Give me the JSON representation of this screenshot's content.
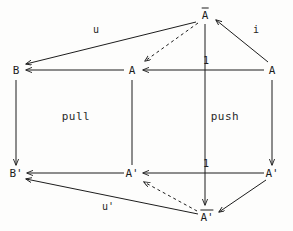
{
  "diagram": {
    "type": "commutative-diagram",
    "stroke_color": "#1d1d1d",
    "background_color": "#fdfdfc",
    "nodes": [
      {
        "id": "Abar",
        "label": "A",
        "overbar": true,
        "prime": false,
        "display": "Ā",
        "x": 205,
        "y": 14
      },
      {
        "id": "B",
        "label": "B",
        "overbar": false,
        "prime": false,
        "display": "B",
        "x": 16,
        "y": 70
      },
      {
        "id": "A_mid",
        "label": "A",
        "overbar": false,
        "prime": false,
        "display": "A",
        "x": 132,
        "y": 70
      },
      {
        "id": "A_right",
        "label": "A",
        "overbar": false,
        "prime": false,
        "display": "A",
        "x": 272,
        "y": 70
      },
      {
        "id": "Bprime",
        "label": "B'",
        "overbar": false,
        "prime": true,
        "display": "B'",
        "x": 16,
        "y": 173
      },
      {
        "id": "Aprime_mid",
        "label": "A'",
        "overbar": false,
        "prime": true,
        "display": "A'",
        "x": 132,
        "y": 173
      },
      {
        "id": "Aprime_rt",
        "label": "A'",
        "overbar": false,
        "prime": true,
        "display": "A'",
        "x": 272,
        "y": 173
      },
      {
        "id": "Abarprime",
        "label": "A'",
        "overbar": true,
        "prime": true,
        "display": "Ā'",
        "x": 207,
        "y": 216
      }
    ],
    "edge_labels": [
      {
        "id": "u",
        "text": "u",
        "x": 96,
        "y": 30
      },
      {
        "id": "i",
        "text": "i",
        "x": 256,
        "y": 30
      },
      {
        "id": "one_top",
        "text": "1",
        "x": 206,
        "y": 61
      },
      {
        "id": "one_bot",
        "text": "1",
        "x": 206,
        "y": 164
      },
      {
        "id": "uprime",
        "text": "u'",
        "x": 108,
        "y": 207
      }
    ],
    "region_labels": [
      {
        "id": "pull",
        "text": "pull",
        "x": 76,
        "y": 116
      },
      {
        "id": "push",
        "text": "push",
        "x": 225,
        "y": 116
      }
    ],
    "edges": [
      {
        "id": "edge-abar-to-b",
        "from": "Abar",
        "to": "B",
        "style": "solid",
        "arrow": "end"
      },
      {
        "id": "edge-abar-to-amid",
        "from": "Abar",
        "to": "A_mid",
        "style": "dashed",
        "arrow": "end"
      },
      {
        "id": "edge-aright-to-abar",
        "from": "A_right",
        "to": "Abar",
        "style": "solid",
        "arrow": "end"
      },
      {
        "id": "edge-amid-to-b",
        "from": "A_mid",
        "to": "B",
        "style": "solid",
        "arrow": "end"
      },
      {
        "id": "edge-aright-to-amid",
        "from": "A_right",
        "to": "A_mid",
        "style": "solid",
        "arrow": "end"
      },
      {
        "id": "edge-b-to-bprime",
        "from": "B",
        "to": "Bprime",
        "style": "solid",
        "arrow": "end"
      },
      {
        "id": "edge-amid-to-aprimemid",
        "from": "A_mid",
        "to": "Aprime_mid",
        "style": "solid",
        "arrow": "none"
      },
      {
        "id": "edge-abar-to-abarprime",
        "from": "Abar",
        "to": "Abarprime",
        "style": "solid",
        "arrow": "end"
      },
      {
        "id": "edge-aright-to-aprimert",
        "from": "A_right",
        "to": "Aprime_rt",
        "style": "solid",
        "arrow": "end"
      },
      {
        "id": "edge-aprimemid-to-bprime",
        "from": "Aprime_mid",
        "to": "Bprime",
        "style": "solid",
        "arrow": "end"
      },
      {
        "id": "edge-aprimert-to-aprimemid",
        "from": "Aprime_rt",
        "to": "Aprime_mid",
        "style": "solid",
        "arrow": "end"
      },
      {
        "id": "edge-abarprime-to-bprime",
        "from": "Abarprime",
        "to": "Bprime",
        "style": "solid",
        "arrow": "end"
      },
      {
        "id": "edge-abarprime-to-aprimemid",
        "from": "Abarprime",
        "to": "Aprime_mid",
        "style": "dashed",
        "arrow": "end"
      },
      {
        "id": "edge-aprimert-to-abarprime",
        "from": "Aprime_rt",
        "to": "Abarprime",
        "style": "solid",
        "arrow": "end"
      }
    ]
  }
}
